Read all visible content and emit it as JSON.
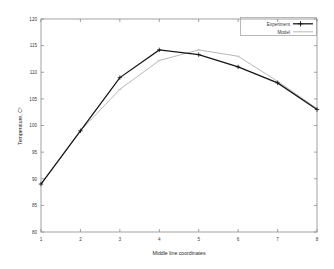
{
  "chart_data": {
    "type": "line",
    "title": "",
    "xlabel": "Middle line coordinates",
    "ylabel": "Temperature, C⁰",
    "x": [
      1,
      2,
      3,
      4,
      5,
      6,
      7,
      8
    ],
    "xlim": [
      1,
      8
    ],
    "ylim": [
      80,
      120
    ],
    "xticks": [
      "1",
      "2",
      "3",
      "4",
      "5",
      "6",
      "7",
      "8"
    ],
    "yticks": [
      "80",
      "85",
      "90",
      "95",
      "100",
      "105",
      "110",
      "115",
      "120"
    ],
    "grid": false,
    "legend_position": "top-right",
    "series": [
      {
        "name": "Experiment",
        "color": "#141414",
        "marker": "plus",
        "values": [
          89.0,
          99.0,
          109.0,
          114.2,
          113.3,
          111.0,
          108.0,
          103.0
        ]
      },
      {
        "name": "Model",
        "color": "#b9b9b9",
        "marker": "none",
        "values": [
          89.0,
          99.0,
          106.8,
          112.2,
          114.2,
          113.0,
          108.3,
          103.2
        ]
      }
    ]
  },
  "legend": {
    "entries": [
      {
        "label": "Experiment"
      },
      {
        "label": "Model"
      }
    ]
  },
  "axes": {
    "x_label": "Middle line coordinates",
    "y_label": "Temperature, C⁰"
  }
}
